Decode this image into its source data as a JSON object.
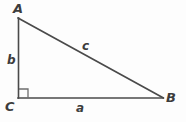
{
  "figure": {
    "background_color": "#fdfdfd",
    "stroke_color": "#4a4a4a",
    "label_color": "#3d3d3d",
    "vertices": [
      {
        "name": "A",
        "label": "A",
        "x": 18,
        "y": 18
      },
      {
        "name": "B",
        "label": "B",
        "x": 163,
        "y": 98
      },
      {
        "name": "C",
        "label": "C",
        "x": 18,
        "y": 98
      }
    ],
    "sides": [
      {
        "name": "a",
        "label": "a",
        "from": "C",
        "to": "B",
        "role": "base"
      },
      {
        "name": "b",
        "label": "b",
        "from": "C",
        "to": "A",
        "role": "height"
      },
      {
        "name": "c",
        "label": "c",
        "from": "A",
        "to": "B",
        "role": "hypotenuse"
      }
    ],
    "right_angle": {
      "at_vertex": "C",
      "marker": "right-angle-square",
      "size": 9
    }
  }
}
